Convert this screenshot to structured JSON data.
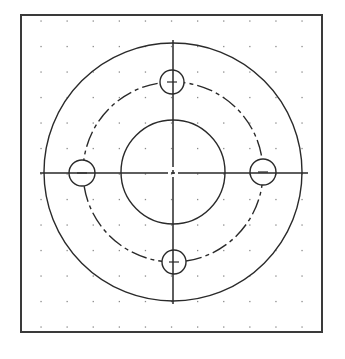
{
  "drawing": {
    "type": "flange-plate-top-view",
    "line_color": "#2a2a2a",
    "frame_color": "#3a3a3a",
    "grid_dot_color": "#8a8a8a",
    "background": "#ffffff"
  },
  "frame": {
    "x": 21,
    "y": 15,
    "width": 301,
    "height": 317
  },
  "grid": {
    "x_start": 41,
    "x_step": 26.1,
    "cols": 11,
    "y_start": 21,
    "y_step": 25.5,
    "rows": 13
  },
  "center": {
    "x": 173,
    "y": 172
  },
  "outer_circle": {
    "r": 129
  },
  "inner_circle": {
    "r": 52
  },
  "bolt_circle": {
    "r": 90,
    "style": "center-dash"
  },
  "bolt_holes": [
    {
      "name": "top",
      "cx": 172,
      "cy": 82,
      "r": 12
    },
    {
      "name": "right",
      "cx": 263,
      "cy": 172,
      "r": 13
    },
    {
      "name": "bottom",
      "cx": 174,
      "cy": 262,
      "r": 12
    },
    {
      "name": "left",
      "cx": 82,
      "cy": 173,
      "r": 13
    }
  ],
  "centerlines": {
    "horizontal": {
      "x1": 40,
      "x2": 308,
      "y": 173
    },
    "vertical": {
      "x": 173,
      "y1": 40,
      "y2": 304
    }
  }
}
